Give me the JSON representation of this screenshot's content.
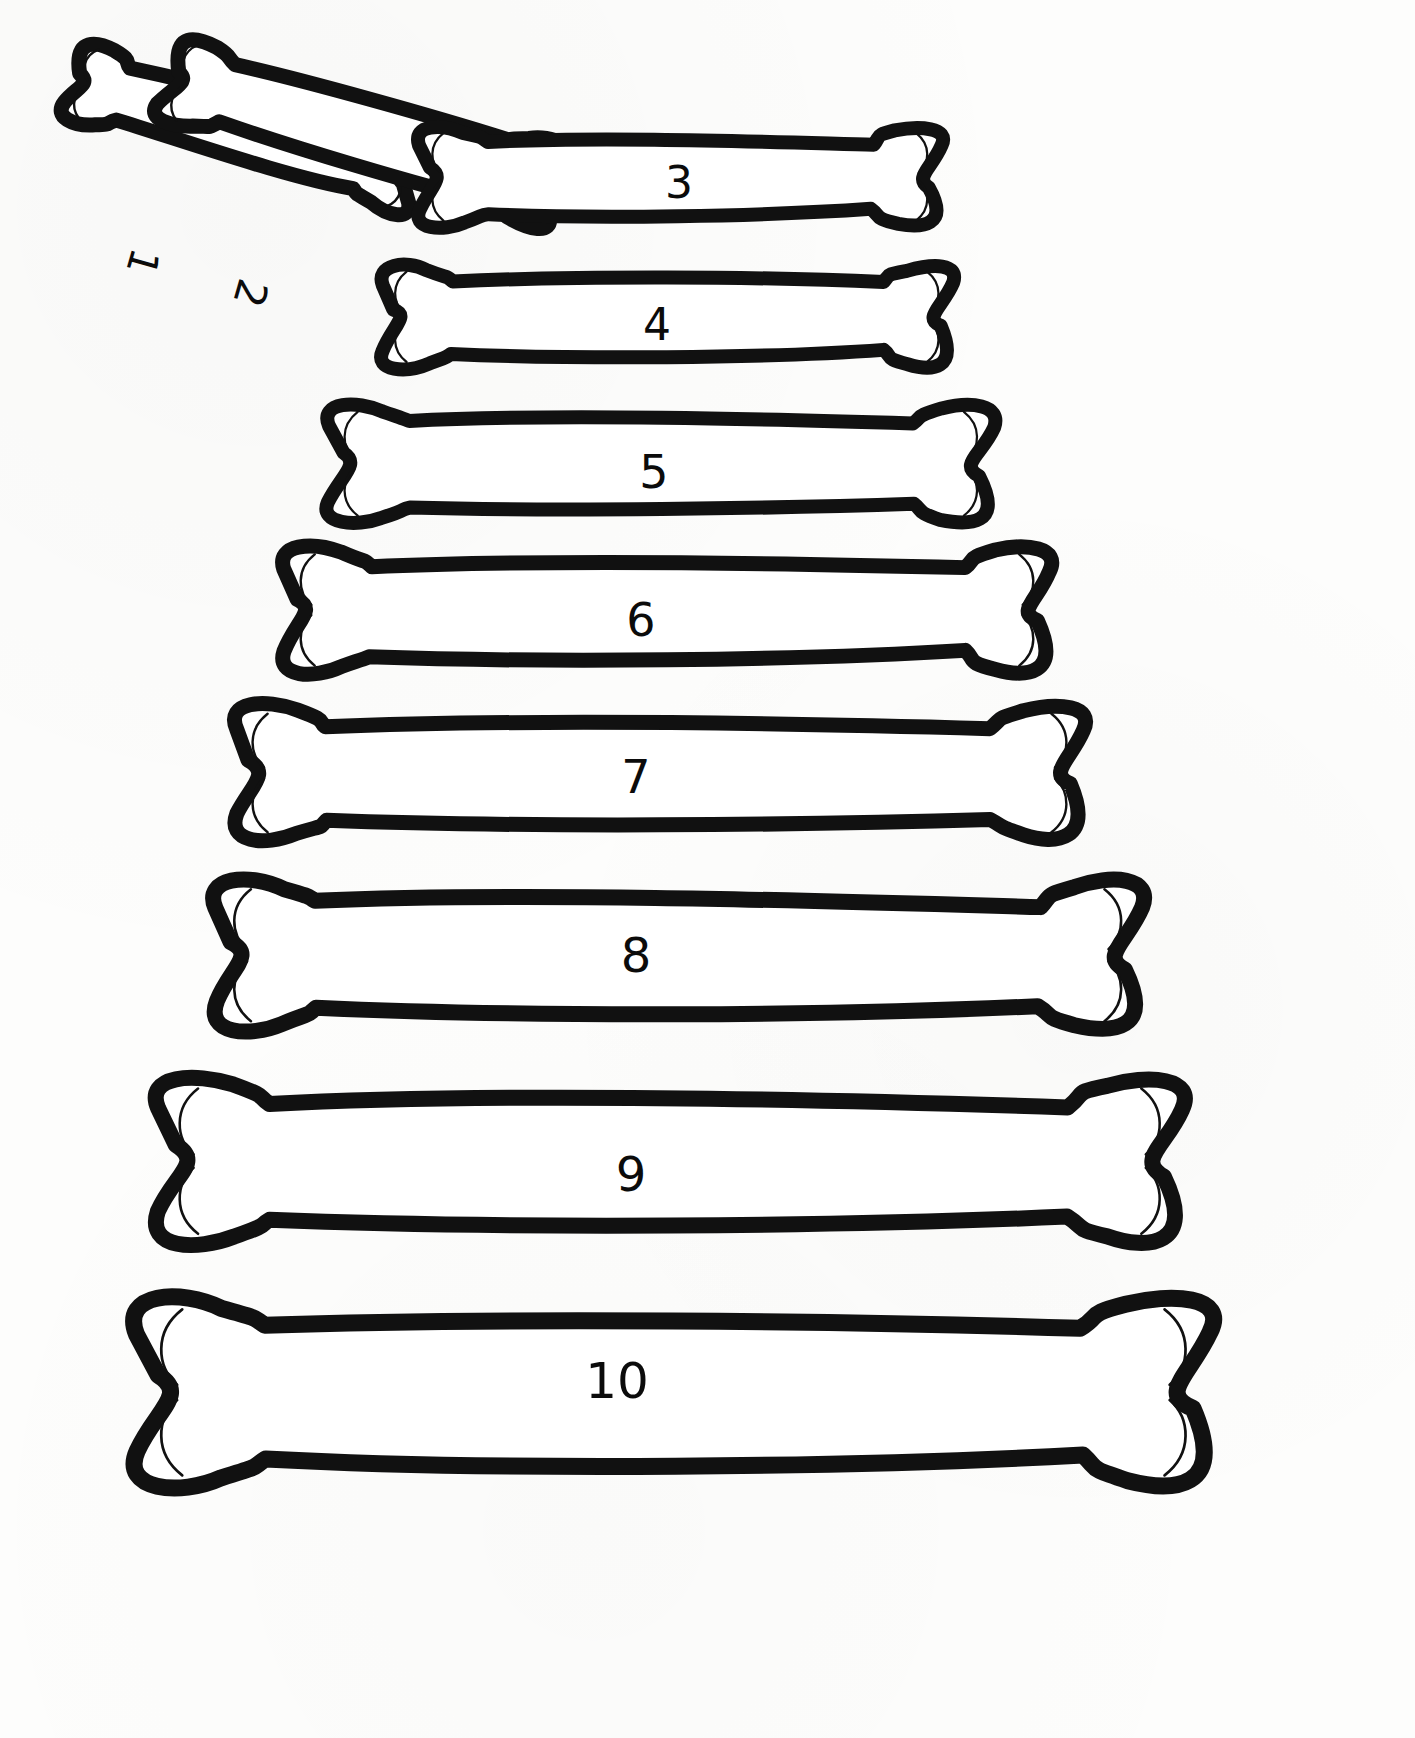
{
  "page": {
    "background_color": "#fdfdfc",
    "ink_color": "#111111",
    "fill_color": "#ffffff",
    "width": 1415,
    "height": 1738,
    "item_count": 10
  },
  "bones": [
    {
      "id": "bone-1",
      "label": "1",
      "orientation": "diagonal",
      "rotation_deg": 196,
      "label_rotation_deg": 106,
      "x": 55,
      "y": 80,
      "length": 375,
      "thickness": 96,
      "stroke_width": 15,
      "label_x": 143,
      "label_y": 262,
      "label_size": 40
    },
    {
      "id": "bone-2",
      "label": "2",
      "orientation": "diagonal",
      "rotation_deg": 196,
      "label_rotation_deg": 106,
      "x": 150,
      "y": 80,
      "length": 425,
      "thickness": 106,
      "stroke_width": 15,
      "label_x": 250,
      "label_y": 293,
      "label_size": 42
    },
    {
      "id": "bone-3",
      "label": "3",
      "orientation": "horizontal",
      "rotation_deg": 0,
      "label_rotation_deg": 0,
      "x": 410,
      "y": 118,
      "length": 540,
      "thickness": 118,
      "stroke_width": 14,
      "label_x": 679,
      "label_y": 183,
      "label_size": 44
    },
    {
      "id": "bone-4",
      "label": "4",
      "orientation": "horizontal",
      "rotation_deg": 0,
      "label_rotation_deg": 0,
      "x": 372,
      "y": 256,
      "length": 590,
      "thickness": 122,
      "stroke_width": 14,
      "label_x": 657,
      "label_y": 325,
      "label_size": 44
    },
    {
      "id": "bone-5",
      "label": "5",
      "orientation": "horizontal",
      "rotation_deg": 0,
      "label_rotation_deg": 0,
      "x": 318,
      "y": 394,
      "length": 686,
      "thickness": 140,
      "stroke_width": 14,
      "label_x": 654,
      "label_y": 472,
      "label_size": 46
    },
    {
      "id": "bone-6",
      "label": "6",
      "orientation": "horizontal",
      "rotation_deg": 0,
      "label_rotation_deg": 0,
      "x": 272,
      "y": 535,
      "length": 790,
      "thickness": 150,
      "stroke_width": 15,
      "label_x": 641,
      "label_y": 620,
      "label_size": 46
    },
    {
      "id": "bone-7",
      "label": "7",
      "orientation": "horizontal",
      "rotation_deg": 0,
      "label_rotation_deg": 0,
      "x": 222,
      "y": 693,
      "length": 875,
      "thickness": 160,
      "stroke_width": 15,
      "label_x": 636,
      "label_y": 777,
      "label_size": 46
    },
    {
      "id": "bone-8",
      "label": "8",
      "orientation": "horizontal",
      "rotation_deg": 0,
      "label_rotation_deg": 0,
      "x": 200,
      "y": 866,
      "length": 955,
      "thickness": 178,
      "stroke_width": 16,
      "label_x": 636,
      "label_y": 955,
      "label_size": 48
    },
    {
      "id": "bone-9",
      "label": "9",
      "orientation": "horizontal",
      "rotation_deg": 0,
      "label_rotation_deg": 0,
      "x": 142,
      "y": 1063,
      "length": 1055,
      "thickness": 196,
      "stroke_width": 16,
      "label_x": 631,
      "label_y": 1174,
      "label_size": 48
    },
    {
      "id": "bone-10",
      "label": "10",
      "orientation": "horizontal",
      "rotation_deg": 0,
      "label_rotation_deg": 0,
      "x": 118,
      "y": 1280,
      "length": 1110,
      "thickness": 224,
      "stroke_width": 17,
      "label_x": 617,
      "label_y": 1381,
      "label_size": 50
    }
  ],
  "chart_data": {
    "type": "bar",
    "xlabel": "",
    "ylabel": "Bone length (px)",
    "categories": [
      "1",
      "2",
      "3",
      "4",
      "5",
      "6",
      "7",
      "8",
      "9",
      "10"
    ],
    "values": [
      375,
      425,
      540,
      590,
      686,
      790,
      875,
      955,
      1055,
      1110
    ],
    "ylim": [
      0,
      1200
    ],
    "grid": false,
    "legend": "none"
  }
}
